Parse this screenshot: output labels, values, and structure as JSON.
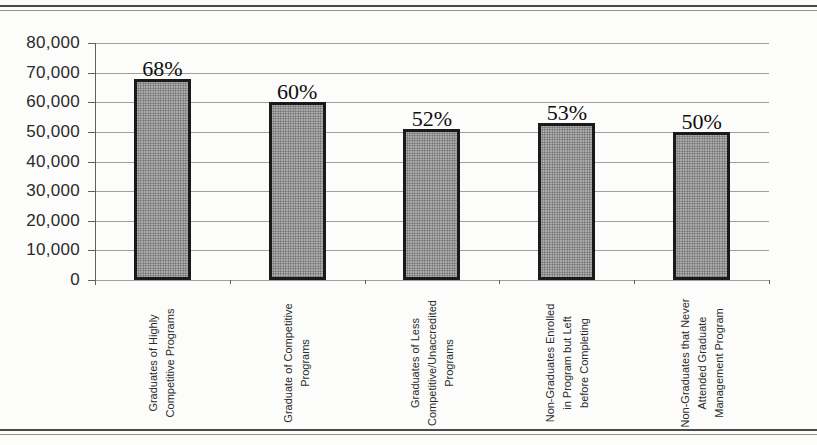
{
  "chart_data": {
    "type": "bar",
    "title": "",
    "xlabel": "",
    "ylabel": "",
    "categories": [
      "Graduates of Highly\nCompetitive Programs",
      "Graduate of Competitive\nPrograms",
      "Graduates of Less\nCompetitive/Unaccredited\nPrograms",
      "Non-Graduates Enrolled\nin Program but Left\nbefore Completing",
      "Non-Graduates that Never\nAttended Graduate\nManagement Program"
    ],
    "values": [
      68000,
      60000,
      51000,
      53000,
      50000
    ],
    "bar_labels": [
      "68%",
      "60%",
      "52%",
      "53%",
      "50%"
    ],
    "y_ticks": [
      "80,000",
      "70,000",
      "60,000",
      "50,000",
      "40,000",
      "30,000",
      "20,000",
      "10,000",
      "0"
    ],
    "ylim": [
      0,
      80000
    ],
    "y_tick_step": 10000,
    "grid": true,
    "legend": "none",
    "colors": {
      "page-bg": "#fcfcfa",
      "bar-fill": "#b6b6b6",
      "bar-dot": "#6e6e6e",
      "bar-border": "#1a1a1a",
      "gridline": "#9f9f9f",
      "axis": "#606060",
      "tick-text": "#2a2a2a",
      "value-text": "#0f0f0f",
      "rule": "#4a4a4a",
      "rule-light": "#909090"
    }
  }
}
